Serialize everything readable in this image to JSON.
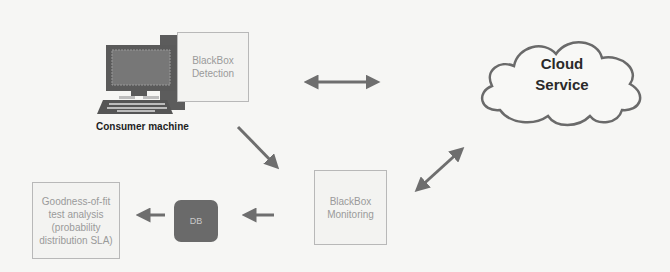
{
  "diagram": {
    "consumer_machine": {
      "label": "Consumer machine",
      "icon": "desktop-computer-icon"
    },
    "blackbox_detection": {
      "line1": "BlackBox",
      "line2": "Detection"
    },
    "cloud_service": {
      "line1": "Cloud",
      "line2": "Service",
      "icon": "cloud-icon"
    },
    "blackbox_monitoring": {
      "line1": "BlackBox",
      "line2": "Monitoring"
    },
    "database": {
      "label": "DB",
      "icon": "database-icon"
    },
    "analysis": {
      "line1": "Goodness-of-fit",
      "line2": "test analysis",
      "line3": "(probability",
      "line4": "distribution SLA)"
    },
    "connections": [
      {
        "from": "BlackBox Detection",
        "to": "Cloud Service",
        "type": "bidirectional"
      },
      {
        "from": "Consumer machine",
        "to": "BlackBox Monitoring",
        "type": "directed"
      },
      {
        "from": "BlackBox Monitoring",
        "to": "Cloud Service",
        "type": "bidirectional"
      },
      {
        "from": "BlackBox Monitoring",
        "to": "DB",
        "type": "directed"
      },
      {
        "from": "DB",
        "to": "Goodness-of-fit test analysis",
        "type": "directed"
      }
    ],
    "colors": {
      "arrow": "#6e6e6e",
      "box_border": "#b8b8b8",
      "box_text": "#9a9a9a",
      "db_fill": "#6a6a6a"
    }
  }
}
